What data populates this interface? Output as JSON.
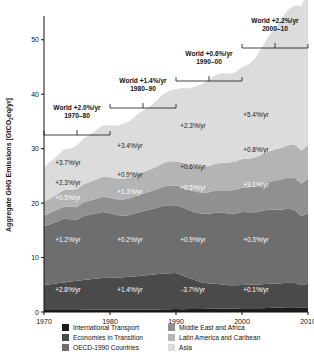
{
  "chart_data": {
    "type": "area",
    "stacked": true,
    "title": "",
    "xlabel": "",
    "ylabel": "Aggregate GHG Emissions [GtCO₂eq/yr]",
    "xlim": [
      1970,
      2010
    ],
    "ylim": [
      0,
      54
    ],
    "yticks": [
      0,
      10,
      20,
      30,
      40,
      50
    ],
    "xticks": [
      1970,
      1980,
      1990,
      2000,
      2010
    ],
    "grid": false,
    "legend_position": "bottom",
    "x": [
      1970,
      1971,
      1972,
      1973,
      1974,
      1975,
      1976,
      1977,
      1978,
      1979,
      1980,
      1981,
      1982,
      1983,
      1984,
      1985,
      1986,
      1987,
      1988,
      1989,
      1990,
      1991,
      1992,
      1993,
      1994,
      1995,
      1996,
      1997,
      1998,
      1999,
      2000,
      2001,
      2002,
      2003,
      2004,
      2005,
      2006,
      2007,
      2008,
      2009,
      2010
    ],
    "series": [
      {
        "name": "International Transport",
        "color": "#1c1c1c",
        "values": [
          0.35,
          0.36,
          0.37,
          0.39,
          0.38,
          0.38,
          0.4,
          0.41,
          0.43,
          0.44,
          0.44,
          0.43,
          0.42,
          0.42,
          0.43,
          0.44,
          0.46,
          0.48,
          0.5,
          0.52,
          0.53,
          0.52,
          0.53,
          0.54,
          0.56,
          0.58,
          0.6,
          0.62,
          0.63,
          0.65,
          0.68,
          0.68,
          0.69,
          0.71,
          0.75,
          0.78,
          0.81,
          0.85,
          0.87,
          0.83,
          0.88
        ]
      },
      {
        "name": "Economies in Transition",
        "color": "#4a4a4a",
        "values": [
          4.6,
          4.75,
          4.9,
          5.05,
          5.2,
          5.35,
          5.5,
          5.6,
          5.72,
          5.8,
          5.85,
          5.9,
          5.95,
          6.05,
          6.15,
          6.25,
          6.35,
          6.45,
          6.55,
          6.6,
          6.62,
          6.2,
          5.7,
          5.25,
          4.85,
          4.65,
          4.6,
          4.45,
          4.3,
          4.25,
          4.3,
          4.32,
          4.3,
          4.38,
          4.42,
          4.4,
          4.48,
          4.5,
          4.45,
          4.1,
          4.3
        ]
      },
      {
        "name": "OECD-1990 Countries",
        "color": "#6e6e6e",
        "values": [
          10.8,
          11.05,
          11.35,
          11.7,
          11.45,
          11.25,
          11.7,
          11.85,
          12.0,
          12.15,
          11.85,
          11.5,
          11.3,
          11.35,
          11.65,
          11.8,
          11.95,
          12.15,
          12.45,
          12.5,
          12.45,
          12.5,
          12.45,
          12.5,
          12.65,
          12.8,
          13.05,
          13.15,
          13.15,
          13.2,
          13.4,
          13.3,
          13.35,
          13.5,
          13.6,
          13.6,
          13.55,
          13.6,
          13.35,
          12.6,
          13.0
        ]
      },
      {
        "name": "Middle East and Africa",
        "color": "#909090",
        "values": [
          1.95,
          2.05,
          2.15,
          2.25,
          2.3,
          2.4,
          2.5,
          2.6,
          2.7,
          2.8,
          2.85,
          2.9,
          3.0,
          3.05,
          3.15,
          3.25,
          3.35,
          3.4,
          3.5,
          3.6,
          3.65,
          3.7,
          3.75,
          3.8,
          3.85,
          3.95,
          4.05,
          4.15,
          4.25,
          4.35,
          4.45,
          4.6,
          4.75,
          4.95,
          5.15,
          5.35,
          5.55,
          5.75,
          5.95,
          6.05,
          6.25
        ]
      },
      {
        "name": "Latin America and Caribean",
        "color": "#b4b4b4",
        "values": [
          2.6,
          2.7,
          2.85,
          3.0,
          3.1,
          3.2,
          3.35,
          3.45,
          3.55,
          3.7,
          3.75,
          3.8,
          3.85,
          3.8,
          3.85,
          3.95,
          4.05,
          4.15,
          4.3,
          4.4,
          4.45,
          4.5,
          4.55,
          4.65,
          4.75,
          4.85,
          4.95,
          5.05,
          5.15,
          5.2,
          5.25,
          5.25,
          5.3,
          5.4,
          5.55,
          5.7,
          5.8,
          5.95,
          6.1,
          6.05,
          6.25
        ]
      },
      {
        "name": "Asia",
        "color": "#dcdcdc",
        "values": [
          6.4,
          6.8,
          7.05,
          7.5,
          7.6,
          8.0,
          8.4,
          8.7,
          9.1,
          9.4,
          9.5,
          9.7,
          10.0,
          10.4,
          10.9,
          11.3,
          11.6,
          12.1,
          12.7,
          13.0,
          13.2,
          13.7,
          14.1,
          14.7,
          15.2,
          15.9,
          16.3,
          16.5,
          16.3,
          16.4,
          16.9,
          17.3,
          18.2,
          19.6,
          21.1,
          22.4,
          23.7,
          24.9,
          25.6,
          26.6,
          28.4
        ]
      }
    ],
    "inline_labels": [
      {
        "series": "Asia",
        "period": "1970-80",
        "text": "+3.7%/yr",
        "x": 68,
        "y": 165,
        "fill": "#1a1a1a"
      },
      {
        "series": "Asia",
        "period": "1980-90",
        "text": "+3.4%/yr",
        "x": 130,
        "y": 148,
        "fill": "#1a1a1a"
      },
      {
        "series": "Asia",
        "period": "1990-00",
        "text": "+2.3%/yr",
        "x": 193,
        "y": 128,
        "fill": "#1a1a1a"
      },
      {
        "series": "Asia",
        "period": "2000-10",
        "text": "+5.4%/yr",
        "x": 256,
        "y": 117,
        "fill": "#1a1a1a"
      },
      {
        "series": "Latin America and Caribean",
        "period": "1970-80",
        "text": "+2.3%/yr",
        "x": 68,
        "y": 185,
        "fill": "#1a1a1a"
      },
      {
        "series": "Latin America and Caribean",
        "period": "1980-90",
        "text": "+0.9%/yr",
        "x": 130,
        "y": 177,
        "fill": "#1a1a1a"
      },
      {
        "series": "Latin America and Caribean",
        "period": "1990-00",
        "text": "+0.6%/yr",
        "x": 193,
        "y": 169,
        "fill": "#1a1a1a"
      },
      {
        "series": "Latin America and Caribean",
        "period": "2000-10",
        "text": "+0.8%/yr",
        "x": 256,
        "y": 152,
        "fill": "#1a1a1a"
      },
      {
        "series": "Middle East and Africa",
        "period": "1970-80",
        "text": "+0.5%/yr",
        "x": 68,
        "y": 200,
        "fill": "#ffffff"
      },
      {
        "series": "Middle East and Africa",
        "period": "1980-90",
        "text": "+1.3%/yr",
        "x": 130,
        "y": 194,
        "fill": "#ffffff"
      },
      {
        "series": "Middle East and Africa",
        "period": "1990-00",
        "text": "+0.5%/yr",
        "x": 193,
        "y": 190,
        "fill": "#ffffff"
      },
      {
        "series": "Middle East and Africa",
        "period": "2000-10",
        "text": "+3.1%/yr",
        "x": 256,
        "y": 187,
        "fill": "#ffffff"
      },
      {
        "series": "OECD-1990 Countries",
        "period": "1970-80",
        "text": "+1.2%/yr",
        "x": 68,
        "y": 242,
        "fill": "#ffffff"
      },
      {
        "series": "OECD-1990 Countries",
        "period": "1980-90",
        "text": "+0.2%/yr",
        "x": 130,
        "y": 242,
        "fill": "#ffffff"
      },
      {
        "series": "OECD-1990 Countries",
        "period": "1990-00",
        "text": "+0.9%/yr",
        "x": 193,
        "y": 242,
        "fill": "#ffffff"
      },
      {
        "series": "OECD-1990 Countries",
        "period": "2000-10",
        "text": "+0.3%/yr",
        "x": 256,
        "y": 242,
        "fill": "#ffffff"
      },
      {
        "series": "Economies in Transition",
        "period": "1970-80",
        "text": "+2.8%/yr",
        "x": 68,
        "y": 292,
        "fill": "#ffffff"
      },
      {
        "series": "Economies in Transition",
        "period": "1980-90",
        "text": "+1.4%/yr",
        "x": 130,
        "y": 292,
        "fill": "#ffffff"
      },
      {
        "series": "Economies in Transition",
        "period": "1990-00",
        "text": "-3.7%/yr",
        "x": 193,
        "y": 292,
        "fill": "#ffffff"
      },
      {
        "series": "Economies in Transition",
        "period": "2000-10",
        "text": "+0.1%/yr",
        "x": 256,
        "y": 292,
        "fill": "#ffffff"
      }
    ],
    "period_annotations": [
      {
        "line1": "World +2.0%/yr",
        "line2": "1970–80",
        "x0": 1970,
        "x1": 1980,
        "bracket_y": 135,
        "text_y": 110
      },
      {
        "line1": "World +1.4%/yr",
        "line2": "1980–90",
        "x0": 1980,
        "x1": 1990,
        "bracket_y": 108,
        "text_y": 83
      },
      {
        "line1": "World +0.6%/yr",
        "line2": "1990–00",
        "x0": 1990,
        "x1": 2000,
        "bracket_y": 81,
        "text_y": 56
      },
      {
        "line1": "World +2.2%/yr",
        "line2": "2000–10",
        "x0": 2000,
        "x1": 2010,
        "bracket_y": 48,
        "text_y": 23
      }
    ],
    "legend": [
      {
        "label": "International Transport",
        "color": "#1c1c1c",
        "col": 0,
        "row": 0
      },
      {
        "label": "Economies in Transition",
        "color": "#4a4a4a",
        "col": 0,
        "row": 1
      },
      {
        "label": "OECD-1990 Countries",
        "color": "#6e6e6e",
        "col": 0,
        "row": 2
      },
      {
        "label": "Middle East and Africa",
        "color": "#909090",
        "col": 1,
        "row": 0
      },
      {
        "label": "Latin America and Caribean",
        "color": "#b4b4b4",
        "col": 1,
        "row": 1
      },
      {
        "label": "Asia",
        "color": "#dcdcdc",
        "col": 1,
        "row": 2
      }
    ]
  }
}
